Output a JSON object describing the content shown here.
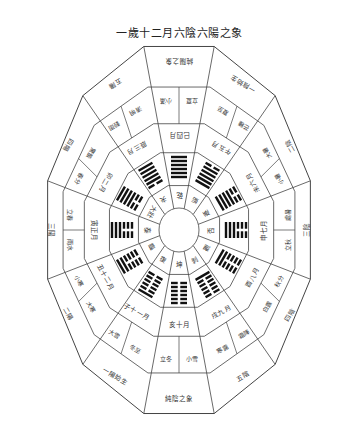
{
  "title": "一歲十二月六陰六陽之象",
  "geometry": {
    "cx": 179,
    "cy": 230,
    "rx": [
      20,
      36,
      64,
      98,
      136
    ],
    "ry": [
      22,
      40,
      70,
      108,
      190
    ],
    "sides": 12
  },
  "colors": {
    "line": "#444444",
    "ink": "#222222",
    "background": "#ffffff"
  },
  "sectors": [
    {
      "month": "四月",
      "branch": "巳",
      "hex": [
        1,
        1,
        1,
        1,
        1,
        1
      ],
      "inner": "乾",
      "solar": [
        "小滿",
        "立夏"
      ],
      "outer": "純陽之象"
    },
    {
      "month": "五月",
      "branch": "午",
      "hex": [
        0,
        1,
        1,
        1,
        1,
        1
      ],
      "inner": "姤",
      "solar": [
        "夏至",
        "芒種"
      ],
      "outer": "一陰始生"
    },
    {
      "month": "六月",
      "branch": "未",
      "hex": [
        0,
        0,
        1,
        1,
        1,
        1
      ],
      "inner": "遯",
      "solar": [
        "大暑",
        "小暑"
      ],
      "outer": "二陰"
    },
    {
      "month": "七月",
      "branch": "申",
      "hex": [
        0,
        0,
        0,
        1,
        1,
        1
      ],
      "inner": "否",
      "solar": [
        "處暑",
        "立秋"
      ],
      "outer": "三陰"
    },
    {
      "month": "八月",
      "branch": "酉",
      "hex": [
        0,
        0,
        0,
        0,
        1,
        1
      ],
      "inner": "觀",
      "solar": [
        "秋分",
        "白露"
      ],
      "outer": "四陰"
    },
    {
      "month": "九月",
      "branch": "戌",
      "hex": [
        0,
        0,
        0,
        0,
        0,
        1
      ],
      "inner": "剝",
      "solar": [
        "霜降",
        "寒露"
      ],
      "outer": "五陰"
    },
    {
      "month": "十月",
      "branch": "亥",
      "hex": [
        0,
        0,
        0,
        0,
        0,
        0
      ],
      "inner": "坤",
      "solar": [
        "小雪",
        "立冬"
      ],
      "outer": "純陰之象"
    },
    {
      "month": "十一月",
      "branch": "子",
      "hex": [
        1,
        0,
        0,
        0,
        0,
        0
      ],
      "inner": "復",
      "solar": [
        "冬至",
        "大雪"
      ],
      "outer": "一陽始生"
    },
    {
      "month": "十二月",
      "branch": "丑",
      "hex": [
        1,
        1,
        0,
        0,
        0,
        0
      ],
      "inner": "臨",
      "solar": [
        "大寒",
        "小寒"
      ],
      "outer": "二陽"
    },
    {
      "month": "正月",
      "branch": "寅",
      "hex": [
        1,
        1,
        1,
        0,
        0,
        0
      ],
      "inner": "泰",
      "solar": [
        "雨水",
        "立春"
      ],
      "outer": "三陽"
    },
    {
      "month": "二月",
      "branch": "卯",
      "hex": [
        1,
        1,
        1,
        1,
        0,
        0
      ],
      "inner": "大壯",
      "solar": [
        "春分",
        "驚蟄"
      ],
      "outer": "四陽"
    },
    {
      "month": "三月",
      "branch": "辰",
      "hex": [
        1,
        1,
        1,
        1,
        1,
        0
      ],
      "inner": "夬",
      "solar": [
        "穀雨",
        "清明"
      ],
      "outer": "五陽"
    }
  ]
}
